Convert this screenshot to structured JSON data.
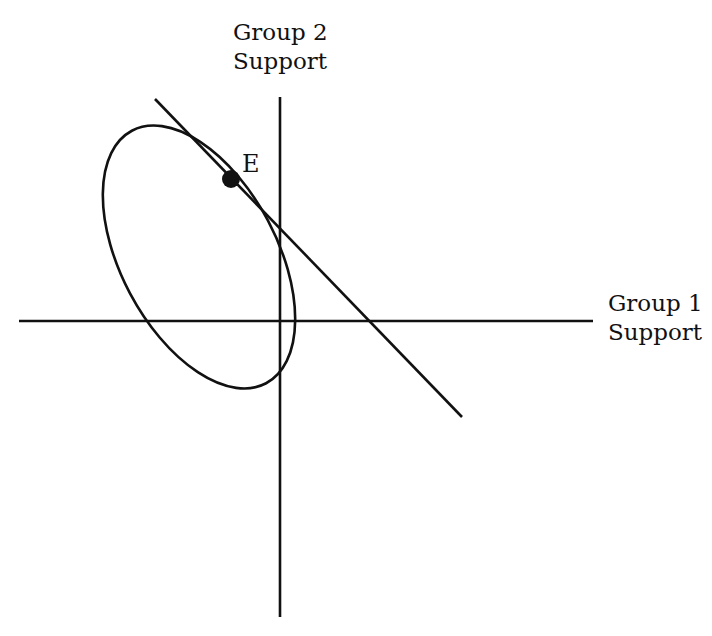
{
  "diagram": {
    "y_axis_label": [
      "Group 2",
      "Support"
    ],
    "x_axis_label": [
      "Group 1",
      "Support"
    ],
    "point_label": "E",
    "elements": [
      {
        "type": "axis",
        "orientation": "horizontal",
        "from": [
          19,
          321
        ],
        "to": [
          593,
          321
        ]
      },
      {
        "type": "axis",
        "orientation": "vertical",
        "from": [
          280,
          97
        ],
        "to": [
          280,
          617
        ]
      },
      {
        "type": "ellipse",
        "center": [
          199,
          257
        ],
        "rx": 145,
        "ry": 80,
        "rotation_deg": 62
      },
      {
        "type": "tangent-line",
        "from": [
          155,
          99
        ],
        "to": [
          462,
          417
        ]
      },
      {
        "type": "point",
        "label": "E",
        "at": [
          231,
          179
        ]
      }
    ],
    "color": "#111111"
  }
}
